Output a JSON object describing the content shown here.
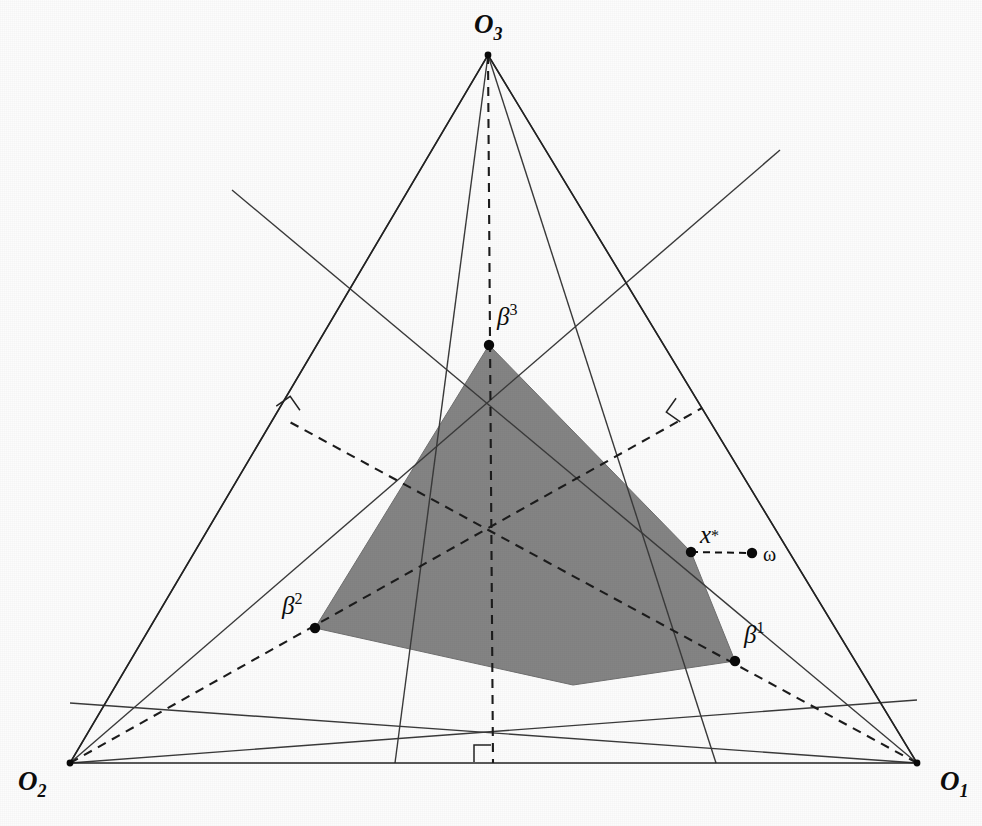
{
  "figure": {
    "domain": "geometry-diagram",
    "background_color": "#fcfcfc",
    "region_fill_color": "#848484",
    "line_color": "#232323",
    "canvas": {
      "width": 982,
      "height": 826
    }
  },
  "corners": [
    {
      "id": "O1",
      "base": "O",
      "sub": "1",
      "label_x": 940,
      "label_y": 790,
      "x": 917,
      "y": 763,
      "name": "corner-o1"
    },
    {
      "id": "O2",
      "base": "O",
      "sub": "2",
      "label_x": 18,
      "label_y": 790,
      "x": 70,
      "y": 763,
      "name": "corner-o2"
    },
    {
      "id": "O3",
      "base": "O",
      "sub": "3",
      "label_x": 474,
      "label_y": 33,
      "x": 488,
      "y": 55,
      "name": "corner-o3"
    }
  ],
  "beta_points": [
    {
      "id": "b1",
      "base": "β",
      "sup": "1",
      "x": 735,
      "y": 661,
      "label_x": 744,
      "label_y": 643,
      "name": "point-beta-1"
    },
    {
      "id": "b2",
      "base": "β",
      "sup": "2",
      "x": 315,
      "y": 628,
      "label_x": 282,
      "label_y": 614,
      "name": "point-beta-2"
    },
    {
      "id": "b3",
      "base": "β",
      "sup": "3",
      "x": 489,
      "y": 345,
      "label_x": 497,
      "label_y": 325,
      "name": "point-beta-3"
    }
  ],
  "special_points": [
    {
      "id": "xstar",
      "base": "x",
      "sup": "*",
      "x": 691,
      "y": 552,
      "label_x": 700,
      "label_y": 543,
      "name": "point-x-star"
    },
    {
      "id": "omega",
      "base": "ω",
      "sup": "",
      "x": 752,
      "y": 553,
      "label_x": 763,
      "label_y": 561,
      "name": "point-omega"
    }
  ],
  "region": {
    "name": "equilibrium-region",
    "vertices": [
      [
        489,
        345
      ],
      [
        691,
        552
      ],
      [
        735,
        661
      ],
      [
        573,
        685
      ],
      [
        315,
        628
      ]
    ]
  },
  "outer_triangle": {
    "name": "outer-triangle",
    "points": [
      [
        488,
        55
      ],
      [
        917,
        763
      ],
      [
        70,
        763
      ]
    ]
  },
  "chords": [
    {
      "name": "chord-o3-to-left-base",
      "from": [
        488,
        55
      ],
      "to": [
        70,
        763
      ]
    },
    {
      "name": "chord-o3-to-right-base",
      "from": [
        488,
        55
      ],
      "to": [
        917,
        763
      ]
    },
    {
      "name": "chord-o3-inner-left",
      "from": [
        488,
        55
      ],
      "to": [
        395,
        763
      ]
    },
    {
      "name": "chord-o3-inner-right",
      "from": [
        488,
        55
      ],
      "to": [
        716,
        763
      ]
    },
    {
      "name": "chord-o2-inner-upper",
      "from": [
        70,
        763
      ],
      "to": [
        780,
        150
      ]
    },
    {
      "name": "chord-o2-inner-lower",
      "from": [
        70,
        763
      ],
      "to": [
        917,
        700
      ]
    },
    {
      "name": "chord-o1-inner-upper",
      "from": [
        917,
        763
      ],
      "to": [
        232,
        190
      ]
    },
    {
      "name": "chord-o1-inner-lower",
      "from": [
        917,
        763
      ],
      "to": [
        70,
        703
      ]
    }
  ],
  "medians": [
    {
      "name": "median-from-o3",
      "from": [
        488,
        55
      ],
      "to": [
        493,
        763
      ]
    },
    {
      "name": "median-from-o2",
      "from": [
        70,
        763
      ],
      "to": [
        702,
        408
      ]
    },
    {
      "name": "median-from-o1",
      "from": [
        917,
        763
      ],
      "to": [
        286,
        420
      ]
    }
  ],
  "right_angles": [
    {
      "name": "right-angle-marker-left",
      "x": 286,
      "y": 420,
      "rotation": -35
    },
    {
      "name": "right-angle-marker-right",
      "x": 690,
      "y": 408,
      "rotation": 215
    },
    {
      "name": "right-angle-marker-bottom",
      "x": 491,
      "y": 762,
      "rotation": -90
    }
  ],
  "omega_connector": {
    "name": "omega-connector",
    "from": [
      691,
      552
    ],
    "to": [
      752,
      553
    ]
  },
  "centroid": {
    "x": 492,
    "y": 528,
    "name": "centroid-intersection"
  }
}
